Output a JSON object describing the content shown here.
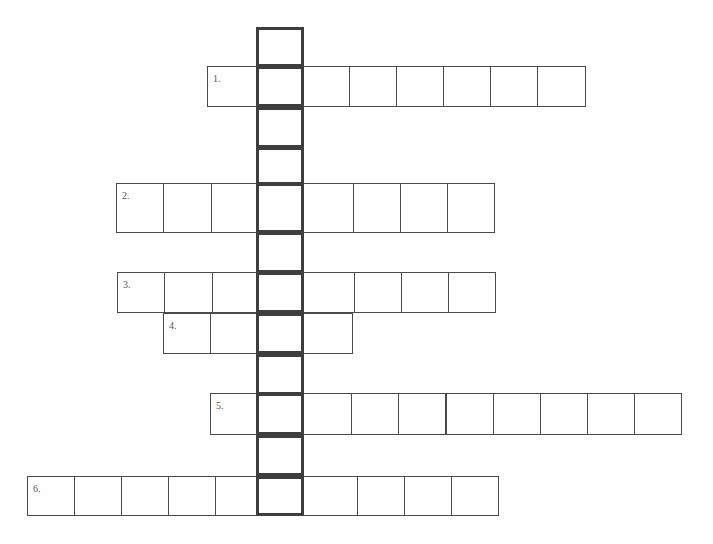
{
  "puzzle": {
    "type": "crossword-hidden-word",
    "colors": {
      "border": "#4a4a4a",
      "highlight_border": "#3e3e3e",
      "background": "#ffffff",
      "number": "#555555"
    },
    "column": {
      "x": 256,
      "width": 48,
      "extra_cells": [
        {
          "y": 27,
          "h": 40
        },
        {
          "y": 107,
          "h": 41
        },
        {
          "y": 147,
          "h": 38
        },
        {
          "y": 232,
          "h": 41
        },
        {
          "y": 354,
          "h": 41
        },
        {
          "y": 435,
          "h": 41
        }
      ]
    },
    "rows": [
      {
        "number": "1.",
        "x": 207,
        "y": 66,
        "h": 41,
        "cell_w": 47.2,
        "count": 8,
        "highlight_index": 1
      },
      {
        "number": "2.",
        "x": 116,
        "y": 183,
        "h": 50,
        "cell_w": 47.3,
        "count": 8,
        "highlight_index": 3
      },
      {
        "number": "3.",
        "x": 117,
        "y": 272,
        "h": 41,
        "cell_w": 47.3,
        "count": 8,
        "highlight_index": 3
      },
      {
        "number": "4.",
        "x": 163,
        "y": 313,
        "h": 41,
        "cell_w": 47.3,
        "count": 4,
        "highlight_index": 2
      },
      {
        "number": "5.",
        "x": 210,
        "y": 393,
        "h": 42,
        "cell_w": 47.1,
        "count": 10,
        "highlight_index": 1
      },
      {
        "number": "6.",
        "x": 27,
        "y": 476,
        "h": 40,
        "cell_w": 47.1,
        "count": 10,
        "highlight_index": 5
      }
    ]
  }
}
